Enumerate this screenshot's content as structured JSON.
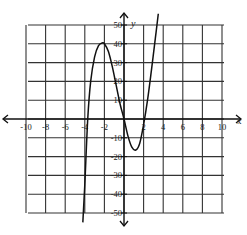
{
  "chart_data": {
    "type": "line",
    "title": "",
    "xlabel": "x",
    "ylabel": "y",
    "xlim": [
      -10,
      10
    ],
    "ylim": [
      -50,
      50
    ],
    "grid": true,
    "x_ticks": [
      -10,
      -8,
      -6,
      -4,
      -2,
      2,
      4,
      6,
      8,
      10
    ],
    "x_tick_labels": [
      "-10",
      "-8",
      "-6",
      "-4",
      "-2",
      "2",
      "4",
      "6",
      "8",
      "10"
    ],
    "y_ticks": [
      50,
      40,
      30,
      20,
      10,
      -10,
      -20,
      -30,
      -40,
      -50
    ],
    "y_tick_labels": [
      "50",
      "40",
      "30",
      "20",
      "10",
      "-10",
      "-20",
      "-30",
      "-40",
      "-50"
    ],
    "series": [
      {
        "name": "f(x)",
        "x": [
          -4.2,
          -4.0,
          -3.7,
          -3.4,
          -3.0,
          -2.6,
          -2.2,
          -2.0,
          -1.6,
          -1.2,
          -0.8,
          -0.4,
          0.0,
          0.4,
          0.8,
          1.2,
          1.6,
          2.0,
          2.4,
          2.8,
          3.2,
          3.5
        ],
        "y": [
          -55,
          -35,
          0,
          20,
          33,
          39,
          40.5,
          40,
          36,
          28,
          18,
          8,
          0,
          -9,
          -15,
          -16.5,
          -13,
          -3,
          10,
          26,
          43,
          56
        ]
      }
    ],
    "key_points": {
      "local_max": [
        -2.2,
        40
      ],
      "local_min": [
        1.2,
        -16.5
      ],
      "x_intercepts": [
        -3.7,
        0,
        2.1
      ]
    },
    "axis_labels": {
      "x": "x",
      "y": "y"
    }
  }
}
